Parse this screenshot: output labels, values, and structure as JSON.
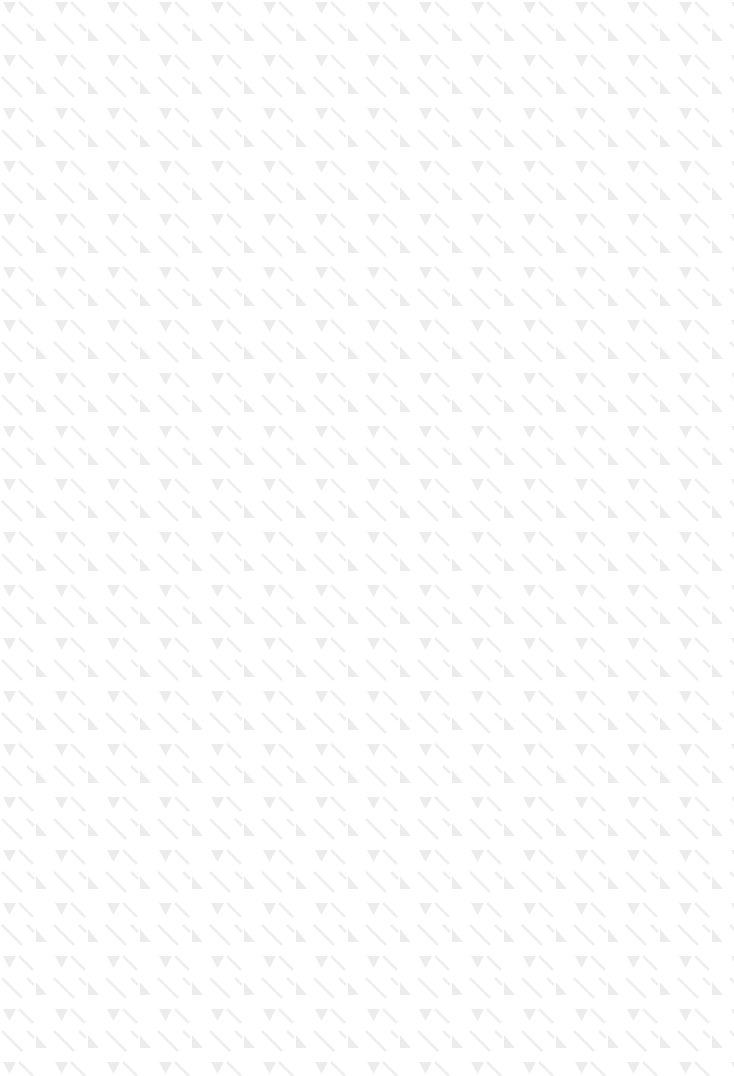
{
  "canvas": {
    "width": 734,
    "height": 1076,
    "background_color": "#ffffff"
  },
  "surface": {
    "state": "empty",
    "has_text": false,
    "has_controls": false,
    "description": "Blank content surface covered only by a faint repeating placeholder texture"
  },
  "texture": {
    "name": "diagonal-slash-triangle-tile",
    "tile_width": 52,
    "tile_height": 53,
    "repeats_horizontal": 14,
    "repeats_vertical": 20,
    "offset_x": 0,
    "offset_y": 0,
    "slash_color": "#eeeef0",
    "triangle_color": "#ececee",
    "slash_angle_deg": 45,
    "glyphs": [
      {
        "name": "triangle-down",
        "position": "top-left"
      },
      {
        "name": "triangle-up",
        "position": "bottom-right"
      },
      {
        "name": "slash-stroke-1",
        "position": "upper-band"
      },
      {
        "name": "slash-stroke-2",
        "position": "mid-band"
      },
      {
        "name": "slash-stroke-3",
        "position": "lower-band"
      }
    ]
  }
}
